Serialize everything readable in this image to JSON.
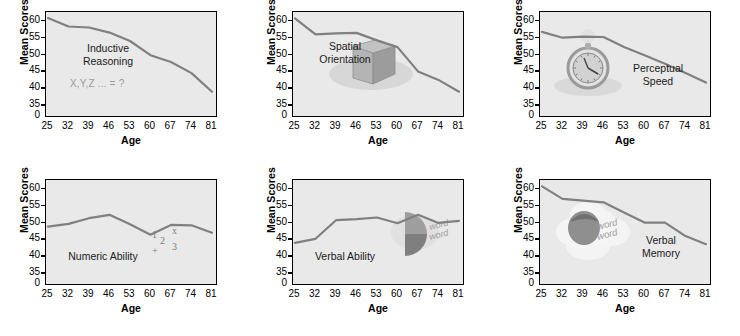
{
  "figure": {
    "axis_titles": {
      "y": "Mean Scores",
      "x": "Age"
    },
    "colors": {
      "line": "#808080",
      "plot_background": "#e9e9e9",
      "axis": "#000000",
      "caption": "#1a1a1a",
      "subcaption": "#9a9a9a"
    }
  },
  "chart_data": [
    {
      "type": "line",
      "title": "Inductive\nReasoning",
      "annotation": "X,Y,Z ... = ?",
      "icon": "formula-text",
      "xlabel": "Age",
      "ylabel": "Mean Scores",
      "x": [
        25,
        32,
        39,
        46,
        53,
        60,
        67,
        74,
        81
      ],
      "xticks": [
        "25",
        "32",
        "39",
        "46",
        "53",
        "60",
        "67",
        "74",
        "81"
      ],
      "yticks": [
        "0",
        "35",
        "40",
        "45",
        "50",
        "55",
        "60"
      ],
      "ylim": [
        33,
        62
      ],
      "values": [
        60.8,
        58.3,
        58.0,
        56.5,
        54.0,
        49.8,
        47.8,
        44.5,
        39.0
      ],
      "grid": false,
      "legend": "none"
    },
    {
      "type": "line",
      "title": "Spatial\nOrientation",
      "annotation": "",
      "icon": "cube-icon",
      "xlabel": "Age",
      "ylabel": "Mean Scores",
      "x": [
        25,
        32,
        39,
        46,
        53,
        60,
        67,
        74,
        81
      ],
      "xticks": [
        "25",
        "32",
        "39",
        "46",
        "53",
        "60",
        "67",
        "74",
        "81"
      ],
      "yticks": [
        "0",
        "35",
        "40",
        "45",
        "50",
        "55",
        "60"
      ],
      "ylim": [
        33,
        62
      ],
      "values": [
        60.7,
        56.0,
        56.3,
        56.4,
        54.2,
        52.2,
        45.0,
        42.5,
        39.0
      ],
      "grid": false,
      "legend": "none"
    },
    {
      "type": "line",
      "title": "Perceptual\nSpeed",
      "annotation": "",
      "icon": "stopwatch-icon",
      "xlabel": "Age",
      "ylabel": "Mean Scores",
      "x": [
        25,
        32,
        39,
        46,
        53,
        60,
        67,
        74,
        81
      ],
      "xticks": [
        "25",
        "32",
        "39",
        "46",
        "53",
        "60",
        "67",
        "74",
        "81"
      ],
      "yticks": [
        "0",
        "35",
        "40",
        "45",
        "50",
        "55",
        "60"
      ],
      "ylim": [
        33,
        62
      ],
      "values": [
        56.7,
        55.0,
        55.3,
        55.2,
        52.2,
        49.8,
        47.3,
        44.5,
        41.7
      ],
      "grid": false,
      "legend": "none"
    },
    {
      "type": "line",
      "title": "Numeric Ability",
      "annotation": "",
      "icon": "numbers-icon",
      "xlabel": "Age",
      "ylabel": "Mean Scores",
      "x": [
        25,
        32,
        39,
        46,
        53,
        60,
        67,
        74,
        81
      ],
      "xticks": [
        "25",
        "32",
        "39",
        "46",
        "53",
        "60",
        "67",
        "74",
        "81"
      ],
      "yticks": [
        "0",
        "35",
        "40",
        "45",
        "50",
        "55",
        "60"
      ],
      "ylim": [
        33,
        62
      ],
      "values": [
        48.8,
        49.6,
        51.3,
        52.3,
        49.5,
        46.4,
        49.3,
        49.2,
        47.0
      ],
      "grid": false,
      "legend": "none"
    },
    {
      "type": "line",
      "title": "Verbal Ability",
      "annotation": "",
      "icon": "speech-word-icon",
      "xlabel": "Age",
      "ylabel": "Mean Scores",
      "x": [
        25,
        32,
        39,
        46,
        53,
        60,
        67,
        74,
        81
      ],
      "xticks": [
        "25",
        "32",
        "39",
        "46",
        "53",
        "60",
        "67",
        "74",
        "81"
      ],
      "yticks": [
        "0",
        "35",
        "40",
        "45",
        "50",
        "55",
        "60"
      ],
      "ylim": [
        33,
        62
      ],
      "values": [
        44.0,
        45.2,
        50.7,
        51.0,
        51.5,
        49.8,
        52.3,
        49.9,
        50.5
      ],
      "grid": false,
      "legend": "none"
    },
    {
      "type": "line",
      "title": "Verbal\nMemory",
      "annotation": "",
      "icon": "thought-cloud-icon",
      "xlabel": "Age",
      "ylabel": "Mean Scores",
      "x": [
        25,
        32,
        39,
        46,
        53,
        60,
        67,
        74,
        81
      ],
      "xticks": [
        "25",
        "32",
        "39",
        "46",
        "53",
        "60",
        "67",
        "74",
        "81"
      ],
      "yticks": [
        "0",
        "35",
        "40",
        "45",
        "50",
        "55",
        "60"
      ],
      "ylim": [
        33,
        62
      ],
      "values": [
        60.7,
        57.0,
        56.5,
        56.0,
        53.0,
        50.0,
        50.0,
        46.0,
        43.6
      ],
      "grid": false,
      "legend": "none"
    }
  ],
  "icon_labels": {
    "numbers": [
      "1",
      "2",
      "3",
      "x",
      "+"
    ],
    "word_bubble": [
      "word",
      "word"
    ]
  }
}
